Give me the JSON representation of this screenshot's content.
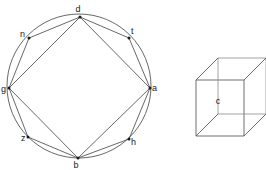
{
  "figure": {
    "background_color": "#ffffff",
    "stroke_color": "#4d4d4d",
    "label_color": "#1a1a1a"
  },
  "graph": {
    "name": "circular-graph",
    "shape": "circle with inscribed octagon and inner square",
    "circle": {
      "cx": 79,
      "cy": 86,
      "r": 72
    },
    "nodes": [
      {
        "id": "d",
        "label": "d",
        "x": 80,
        "y": 17,
        "label_x": 78,
        "label_y": 12,
        "angle_deg": 90
      },
      {
        "id": "t",
        "label": "t",
        "x": 129,
        "y": 38,
        "label_x": 131,
        "label_y": 34,
        "angle_deg": 45
      },
      {
        "id": "a",
        "label": "a",
        "x": 150,
        "y": 88,
        "label_x": 152,
        "label_y": 91,
        "angle_deg": 0
      },
      {
        "id": "h",
        "label": "h",
        "x": 129,
        "y": 139,
        "label_x": 131,
        "label_y": 144,
        "angle_deg": 315
      },
      {
        "id": "b",
        "label": "b",
        "x": 78,
        "y": 158,
        "label_x": 75,
        "label_y": 168,
        "angle_deg": 270
      },
      {
        "id": "z",
        "label": "z",
        "x": 28,
        "y": 137,
        "label_x": 22,
        "label_y": 140,
        "angle_deg": 225
      },
      {
        "id": "g",
        "label": "g",
        "x": 9,
        "y": 88,
        "label_x": 2,
        "label_y": 92,
        "angle_deg": 180
      },
      {
        "id": "n",
        "label": "n",
        "x": 29,
        "y": 38,
        "label_x": 22,
        "label_y": 36,
        "angle_deg": 135
      }
    ],
    "edges": [
      {
        "from": "d",
        "to": "t",
        "type": "perimeter"
      },
      {
        "from": "t",
        "to": "a",
        "type": "perimeter"
      },
      {
        "from": "a",
        "to": "h",
        "type": "perimeter"
      },
      {
        "from": "h",
        "to": "b",
        "type": "perimeter"
      },
      {
        "from": "b",
        "to": "z",
        "type": "perimeter"
      },
      {
        "from": "z",
        "to": "g",
        "type": "perimeter"
      },
      {
        "from": "g",
        "to": "n",
        "type": "perimeter"
      },
      {
        "from": "n",
        "to": "d",
        "type": "perimeter"
      },
      {
        "from": "d",
        "to": "a",
        "type": "chord"
      },
      {
        "from": "a",
        "to": "b",
        "type": "chord"
      },
      {
        "from": "b",
        "to": "g",
        "type": "chord"
      },
      {
        "from": "g",
        "to": "d",
        "type": "chord"
      }
    ],
    "node_count": 8,
    "edge_count": 12
  },
  "cube": {
    "name": "wireframe-cube",
    "label": "c",
    "label_x": 218,
    "label_y": 101,
    "front_face": {
      "x": 196,
      "y": 80,
      "width": 48,
      "height": 56
    },
    "offset_x": 22,
    "offset_y": -22
  }
}
